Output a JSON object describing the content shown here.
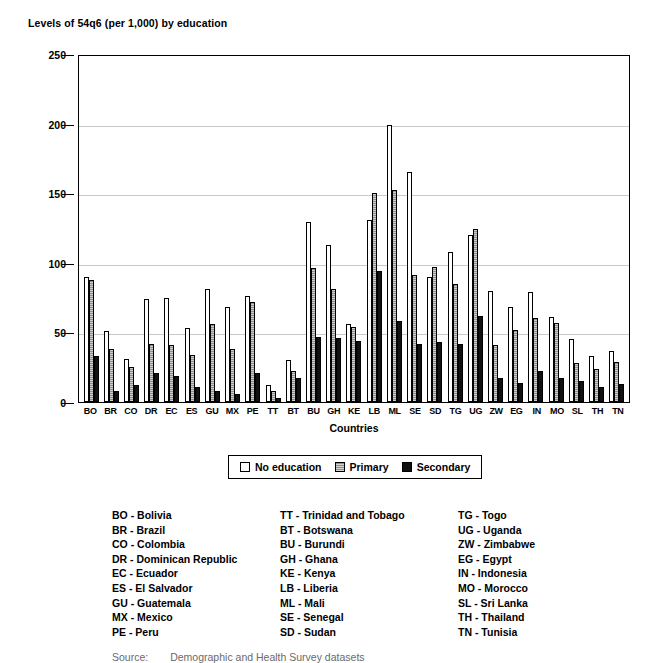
{
  "chart_data": {
    "type": "bar",
    "title": "Levels of 54q6 (per 1,000) by education",
    "xlabel": "Countries",
    "ylabel": "",
    "ylim": [
      0,
      250
    ],
    "yticks": [
      0,
      50,
      100,
      150,
      200,
      250
    ],
    "grid": true,
    "legend_position": "below-axes",
    "categories": [
      "BO",
      "BR",
      "CO",
      "DR",
      "EC",
      "ES",
      "GU",
      "MX",
      "PE",
      "TT",
      "BT",
      "BU",
      "GH",
      "KE",
      "LB",
      "ML",
      "SE",
      "SD",
      "TG",
      "UG",
      "ZW",
      "EG",
      "IN",
      "MO",
      "SL",
      "TH",
      "TN"
    ],
    "series": [
      {
        "name": "No education",
        "color": "#ffffff",
        "values": [
          90,
          51,
          31,
          74,
          75,
          53,
          81,
          68,
          76,
          12,
          30,
          129,
          113,
          56,
          131,
          199,
          165,
          90,
          108,
          120,
          80,
          68,
          79,
          61,
          45,
          33,
          37
        ]
      },
      {
        "name": "Primary",
        "color": "#8f8f8f",
        "values": [
          88,
          38,
          25,
          42,
          41,
          34,
          56,
          38,
          72,
          8,
          22,
          96,
          81,
          54,
          150,
          152,
          91,
          97,
          85,
          124,
          41,
          52,
          60,
          57,
          28,
          24,
          29
        ]
      },
      {
        "name": "Secondary",
        "color": "#111111",
        "values": [
          33,
          8,
          12,
          21,
          19,
          11,
          8,
          6,
          21,
          3,
          17,
          47,
          46,
          44,
          94,
          58,
          42,
          43,
          42,
          62,
          17,
          14,
          22,
          17,
          15,
          11,
          13
        ]
      }
    ]
  },
  "legend": {
    "items": [
      {
        "label": "No education",
        "swatch": "white-swatch"
      },
      {
        "label": "Primary",
        "swatch": "gray-swatch"
      },
      {
        "label": "Secondary",
        "swatch": "black-swatch"
      }
    ]
  },
  "country_key": {
    "columns": [
      [
        "BO - Bolivia",
        "BR - Brazil",
        "CO - Colombia",
        "DR - Dominican Republic",
        "EC - Ecuador",
        "ES - El Salvador",
        "GU - Guatemala",
        "MX - Mexico",
        "PE - Peru"
      ],
      [
        "TT - Trinidad and Tobago",
        "BT - Botswana",
        "BU - Burundi",
        "GH - Ghana",
        "KE - Kenya",
        "LB - Liberia",
        "ML - Mali",
        "SE - Senegal",
        "SD - Sudan"
      ],
      [
        "TG - Togo",
        "UG - Uganda",
        "ZW - Zimbabwe",
        "EG - Egypt",
        "IN - Indonesia",
        "MO - Morocco",
        "SL - Sri Lanka",
        "TH - Thailand",
        "TN - Tunisia"
      ]
    ]
  },
  "source": {
    "label": "Source:",
    "text": "Demographic and Health Survey datasets"
  }
}
